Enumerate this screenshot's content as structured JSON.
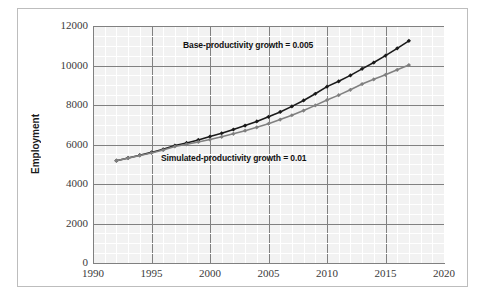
{
  "chart_data": {
    "type": "line",
    "title": "",
    "subtitle": "",
    "xlabel": "",
    "ylabel": "Employment",
    "xlim": [
      1990,
      2020
    ],
    "ylim": [
      0,
      12000
    ],
    "x_ticks": [
      1990,
      1995,
      2000,
      2005,
      2010,
      2015,
      2020
    ],
    "y_ticks": [
      0,
      2000,
      4000,
      6000,
      8000,
      10000,
      12000
    ],
    "grid": true,
    "minor_grid": true,
    "legend_position": "none",
    "x": [
      1992,
      1993,
      1994,
      1995,
      1996,
      1997,
      1998,
      1999,
      2000,
      2001,
      2002,
      2003,
      2004,
      2005,
      2006,
      2007,
      2008,
      2009,
      2010,
      2011,
      2012,
      2013,
      2014,
      2015,
      2016,
      2017
    ],
    "series": [
      {
        "name": "Base-productivity growth = 0.005",
        "color": "#1a1a1a",
        "marker": "diamond",
        "values": [
          5180,
          5320,
          5460,
          5600,
          5760,
          5950,
          6080,
          6230,
          6400,
          6570,
          6760,
          6960,
          7170,
          7400,
          7650,
          7930,
          8230,
          8570,
          8930,
          9200,
          9500,
          9830,
          10150,
          10500,
          10870,
          11250
        ]
      },
      {
        "name": "Simulated-productivity growth = 0.01",
        "color": "#808080",
        "marker": "diamond",
        "values": [
          5180,
          5310,
          5440,
          5570,
          5720,
          5900,
          6010,
          6130,
          6250,
          6390,
          6540,
          6700,
          6870,
          7050,
          7260,
          7480,
          7720,
          7980,
          8250,
          8500,
          8770,
          9060,
          9300,
          9530,
          9780,
          10020
        ]
      }
    ],
    "annotations": [
      {
        "id": "base",
        "text": "Base-productivity growth = 0.005",
        "x": 2000.6,
        "y": 11300
      },
      {
        "id": "simulated",
        "text": "Simulated-productivity growth = 0.01",
        "x": 1998.6,
        "y": 5300
      }
    ],
    "colors": {
      "base_series": "#1a1a1a",
      "simulated_series": "#808080",
      "plot_background": "#f2f2f2",
      "major_gridline": "#808080",
      "minor_gridline": "#ffffff",
      "axis": "#808080",
      "frame": "#bdbdbd",
      "tick_label": "#3a3a3a",
      "annotation_text": "#111111"
    }
  }
}
